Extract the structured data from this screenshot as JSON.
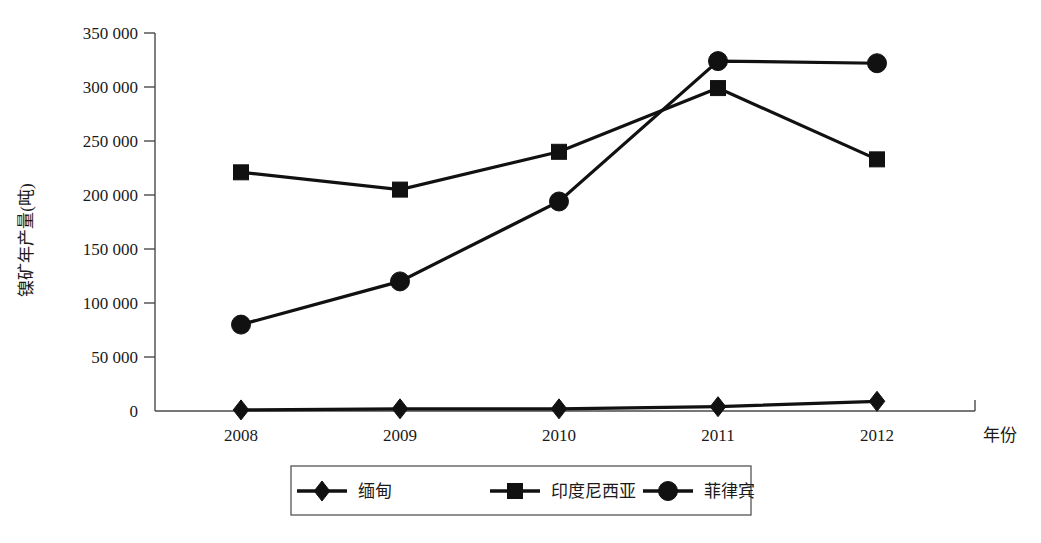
{
  "chart_data": {
    "type": "line",
    "title": "",
    "subtitle": "",
    "xlabel": "年份",
    "ylabel": "镍矿年产量(吨)",
    "categories": [
      "2008",
      "2009",
      "2010",
      "2011",
      "2012"
    ],
    "x": [
      2008,
      2009,
      2010,
      2011,
      2012
    ],
    "xlim": [
      2008,
      2012
    ],
    "ylim": [
      0,
      350000
    ],
    "ytick_values": [
      0,
      50000,
      100000,
      150000,
      200000,
      250000,
      300000,
      350000
    ],
    "ytick_labels": [
      "0",
      "50 000",
      "100 000",
      "150 000",
      "200 000",
      "250 000",
      "300 000",
      "350 000"
    ],
    "grid": false,
    "legend_position": "bottom",
    "series": [
      {
        "name": "缅甸",
        "marker": "diamond",
        "color": "#111111",
        "values": [
          1000,
          2000,
          2000,
          4000,
          9000
        ]
      },
      {
        "name": "印度尼西亚",
        "marker": "square",
        "color": "#111111",
        "values": [
          221000,
          205000,
          240000,
          299000,
          233000
        ]
      },
      {
        "name": "菲律宾",
        "marker": "circle",
        "color": "#111111",
        "values": [
          80000,
          120000,
          194000,
          324000,
          322000
        ]
      }
    ]
  },
  "axes": {
    "y_tick_0": "0",
    "y_tick_1": "50 000",
    "y_tick_2": "100 000",
    "y_tick_3": "150 000",
    "y_tick_4": "200 000",
    "y_tick_5": "250 000",
    "y_tick_6": "300 000",
    "y_tick_7": "350 000",
    "x_tick_0": "2008",
    "x_tick_1": "2009",
    "x_tick_2": "2010",
    "x_tick_3": "2011",
    "x_tick_4": "2012",
    "x_axis_title": "年份",
    "y_axis_title": "镍矿年产量(吨)"
  },
  "legend": {
    "items": [
      {
        "label": "缅甸",
        "marker": "diamond"
      },
      {
        "label": "印度尼西亚",
        "marker": "square"
      },
      {
        "label": "菲律宾",
        "marker": "circle"
      }
    ]
  },
  "colors": {
    "series": "#111111",
    "axis": "#4a4a4a",
    "legend_border": "#555555",
    "background": "#ffffff"
  }
}
